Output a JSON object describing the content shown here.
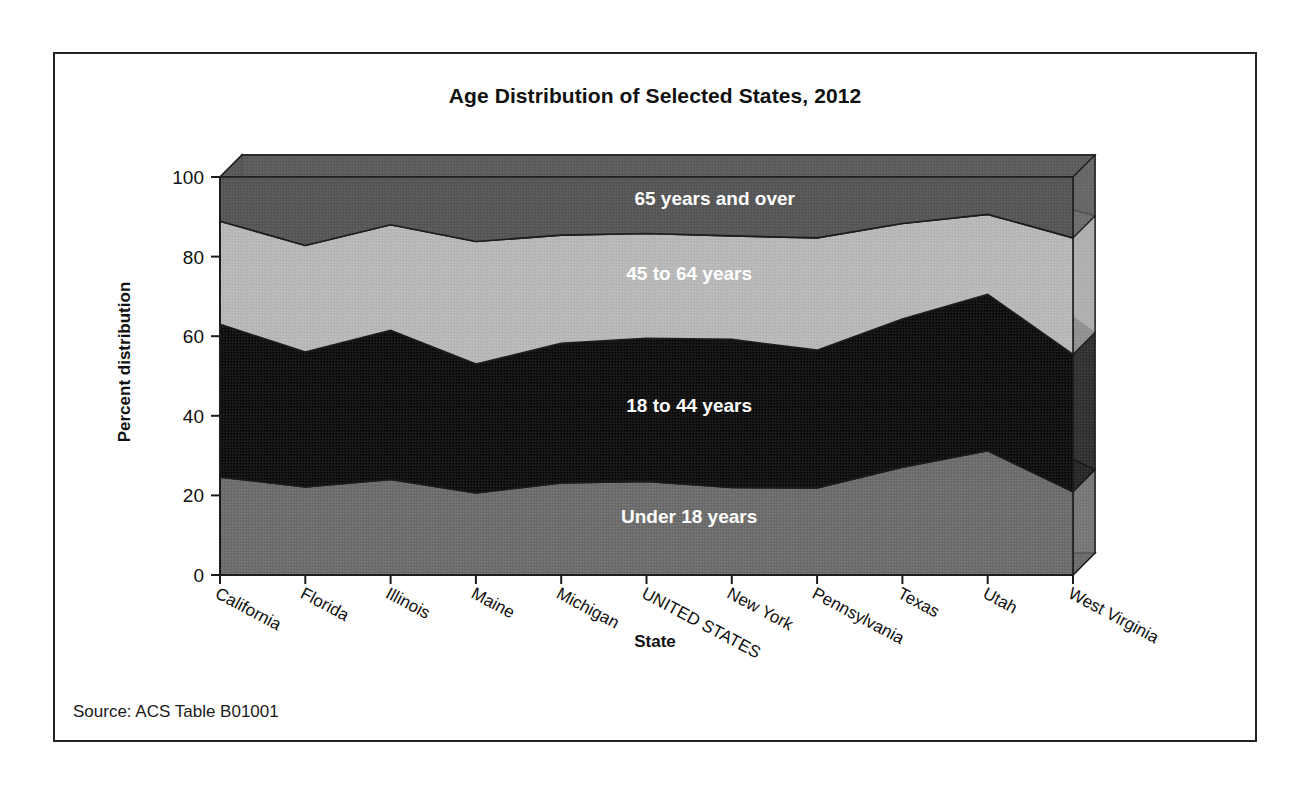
{
  "figure": {
    "source_note": "Source: ACS Table B01001"
  },
  "chart_data": {
    "type": "area",
    "stacked": true,
    "title": "Age Distribution of Selected States, 2012",
    "xlabel": "State",
    "ylabel": "Percent distribution",
    "ylim": [
      0,
      100
    ],
    "yticks": [
      0,
      20,
      40,
      60,
      80,
      100
    ],
    "ytick_labels": [
      "0",
      "20",
      "40",
      "60",
      "80",
      "100"
    ],
    "grid": false,
    "legend_position": "inline-labels",
    "categories": [
      "California",
      "Florida",
      "Illinois",
      "Maine",
      "Michigan",
      "UNITED STATES",
      "New York",
      "Pennsylvania",
      "Texas",
      "Utah",
      "West Virginia"
    ],
    "series": [
      {
        "name": "Under 18 years",
        "color": "#6e6e6e",
        "values": [
          24.6,
          22.1,
          24.0,
          20.6,
          23.1,
          23.5,
          22.0,
          21.9,
          27.1,
          31.2,
          20.9
        ]
      },
      {
        "name": "18 to 44 years",
        "color": "#131313",
        "values": [
          38.4,
          33.9,
          37.5,
          32.4,
          35.1,
          36.0,
          37.2,
          34.6,
          37.2,
          39.3,
          34.5
        ]
      },
      {
        "name": "45 to 64 years",
        "color": "#b8b8b8",
        "values": [
          25.9,
          26.8,
          26.5,
          30.8,
          27.2,
          26.3,
          26.0,
          28.2,
          24.0,
          20.1,
          29.3
        ]
      },
      {
        "name": "65 years and over",
        "color": "#585858",
        "values": [
          11.1,
          17.2,
          12.0,
          16.2,
          14.6,
          14.2,
          14.8,
          15.3,
          11.7,
          9.4,
          15.3
        ]
      }
    ],
    "cumulative_tops": {
      "under_18": [
        24.6,
        22.1,
        24.0,
        20.6,
        23.1,
        23.5,
        22.0,
        21.9,
        27.1,
        31.2,
        20.9
      ],
      "through_44": [
        63.0,
        56.0,
        61.5,
        53.0,
        58.2,
        59.5,
        59.2,
        56.5,
        64.3,
        70.5,
        55.4
      ],
      "through_64": [
        88.9,
        82.8,
        88.0,
        83.8,
        85.4,
        85.8,
        85.2,
        84.7,
        88.3,
        90.6,
        84.7
      ],
      "total": [
        100,
        100,
        100,
        100,
        100,
        100,
        100,
        100,
        100,
        100,
        100
      ]
    },
    "inline_labels": [
      {
        "text": "65 years and over",
        "x_pct": 58,
        "y_value": 93
      },
      {
        "text": "45 to 64 years",
        "x_pct": 55,
        "y_value": 74
      },
      {
        "text": "18 to 44 years",
        "x_pct": 55,
        "y_value": 41
      },
      {
        "text": "Under 18 years",
        "x_pct": 55,
        "y_value": 13
      }
    ]
  }
}
